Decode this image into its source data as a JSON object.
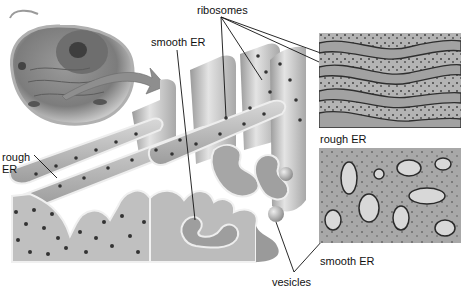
{
  "diagram": {
    "labels": {
      "ribosomes": "ribosomes",
      "smooth_er_top": "smooth ER",
      "rough_er_left": "rough\nER",
      "rough_er_left_line1": "rough",
      "rough_er_left_line2": "ER",
      "rough_er_micrograph": "rough ER",
      "smooth_er_micrograph": "smooth ER",
      "vesicles": "vesicles"
    },
    "panels": [
      {
        "name": "cell-illustration",
        "description": "animal cell cutaway"
      },
      {
        "name": "er-3d-illustration",
        "description": "3D ER with ribosomes"
      },
      {
        "name": "rough-er-micrograph",
        "caption": "rough ER"
      },
      {
        "name": "smooth-er-micrograph",
        "caption": "smooth ER"
      }
    ],
    "colors": {
      "background": "#ffffff",
      "illustration_gray": "#bdbdbd",
      "ribosome_dot": "#3a3a3a",
      "label_text": "#111111"
    }
  }
}
